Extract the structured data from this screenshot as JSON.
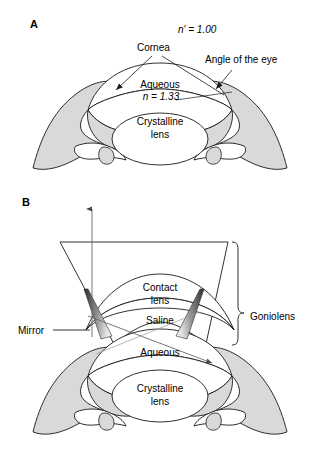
{
  "figure": {
    "type": "anatomical-diagram",
    "background_color": "#ffffff",
    "stroke_color": "#1a1a1a",
    "sclera_fill": "#d9d9d9",
    "interior_fill": "#ffffff",
    "mirror_fill_dark": "#3a3a3a",
    "mirror_fill_light": "#e2e2e2"
  },
  "panels": [
    {
      "id": "A",
      "label": "A",
      "labels": [
        {
          "name": "refractive-index-air",
          "text": "n′ = 1.00",
          "italic_prefix": "n′",
          "x": 178,
          "y": 33
        },
        {
          "name": "cornea",
          "text": "Cornea",
          "x": 137,
          "y": 51
        },
        {
          "name": "angle-of-the-eye",
          "text": "Angle of the eye",
          "x": 205,
          "y": 63
        },
        {
          "name": "aqueous",
          "text": "Aqueous",
          "x": 138,
          "y": 88
        },
        {
          "name": "refractive-index-aqueous",
          "text": "n = 1.33",
          "x": 139,
          "y": 99
        },
        {
          "name": "crystalline-lens-line1",
          "text": "Crystalline",
          "x": 136,
          "y": 123
        },
        {
          "name": "crystalline-lens-line2",
          "text": "lens",
          "x": 148,
          "y": 136
        }
      ]
    },
    {
      "id": "B",
      "label": "B",
      "labels": [
        {
          "name": "contact-lens-line1",
          "text": "Contact",
          "x": 142,
          "y": 288
        },
        {
          "name": "contact-lens-line2",
          "text": "lens",
          "x": 152,
          "y": 301
        },
        {
          "name": "saline",
          "text": "Saline",
          "x": 146,
          "y": 320
        },
        {
          "name": "goniolens",
          "text": "Goniolens",
          "x": 259,
          "y": 316
        },
        {
          "name": "mirror",
          "text": "Mirror",
          "x": 23,
          "y": 333
        },
        {
          "name": "aqueous",
          "text": "Aqueous",
          "x": 140,
          "y": 352
        },
        {
          "name": "crystalline-lens-line1",
          "text": "Crystalline",
          "x": 136,
          "y": 390
        },
        {
          "name": "crystalline-lens-line2",
          "text": "lens",
          "x": 148,
          "y": 403
        }
      ]
    }
  ],
  "annotations": {
    "leader_lines": [
      {
        "name": "cornea-leader-left",
        "from": [
          152,
          56
        ],
        "to": [
          116,
          90
        ]
      },
      {
        "name": "cornea-leader-right",
        "from": [
          160,
          56
        ],
        "to": [
          224,
          94
        ]
      },
      {
        "name": "angle-leader",
        "from": [
          230,
          69
        ],
        "to": [
          215,
          88
        ]
      },
      {
        "name": "mirror-leader",
        "from": [
          52,
          330
        ],
        "to": [
          86,
          330
        ]
      }
    ],
    "rays": [
      {
        "name": "vertical-ray",
        "from": [
          92,
          335
        ],
        "to": [
          92,
          207
        ],
        "arrowhead": "up"
      },
      {
        "name": "reflected-ray",
        "from": [
          88,
          317
        ],
        "to": [
          210,
          362
        ],
        "arrowhead": "mid-right"
      }
    ],
    "bracket": {
      "name": "goniolens-bracket",
      "top": 242,
      "bottom": 345,
      "x": 236
    }
  }
}
